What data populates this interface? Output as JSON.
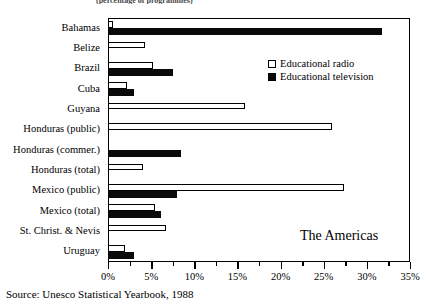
{
  "figure": {
    "top_fragment": "(percentage of programmes)",
    "region_note": "The Americas",
    "source": "Source: Unesco Statistical Yearbook, 1988"
  },
  "legend": {
    "position": "top-right-inside",
    "entries": [
      {
        "label": "Educational radio",
        "color": "#ffffff",
        "style": "hollow"
      },
      {
        "label": "Educational television",
        "color": "#0a0a0a",
        "style": "filled"
      }
    ]
  },
  "chart_data": {
    "type": "bar",
    "orientation": "horizontal",
    "title": "",
    "subtitle": "",
    "xlabel": "",
    "ylabel": "",
    "xlim": [
      0,
      35
    ],
    "xunit": "%",
    "grid": false,
    "xticks": [
      0,
      5,
      10,
      15,
      20,
      25,
      30,
      35
    ],
    "xticklabels": [
      "0%",
      "5%",
      "10%",
      "15%",
      "20%",
      "25%",
      "30%",
      "35%"
    ],
    "xminorticks": [
      2.5,
      7.5,
      12.5,
      17.5,
      22.5,
      27.5,
      32.5
    ],
    "categories": [
      "Bahamas",
      "Belize",
      "Brazil",
      "Cuba",
      "Guyana",
      "Honduras (public)",
      "Honduras (commer.)",
      "Honduras (total)",
      "Mexico (public)",
      "Mexico (total)",
      "St. Christ. & Nevis",
      "Uruguay"
    ],
    "series": [
      {
        "name": "Educational radio",
        "color": "#ffffff",
        "values": [
          0.6,
          4.3,
          5.2,
          2.2,
          15.9,
          26.0,
          0,
          4.1,
          27.4,
          5.4,
          6.7,
          2.0
        ]
      },
      {
        "name": "Educational television",
        "color": "#0a0a0a",
        "values": [
          31.8,
          0,
          7.5,
          3.0,
          0,
          0,
          8.5,
          0,
          8.0,
          6.1,
          0,
          3.0
        ]
      }
    ]
  }
}
